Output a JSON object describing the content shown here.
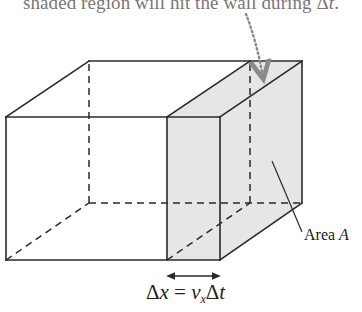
{
  "caption": {
    "text": "shaded region will hit the wall during ",
    "symbol": "Δ",
    "var": "t",
    "end": "."
  },
  "labels": {
    "area": {
      "text": "Area ",
      "var": "A"
    },
    "displacement": {
      "lhs_delta": "Δ",
      "lhs_var": "x",
      "equals": " = ",
      "v": "v",
      "v_sub": "x",
      "rhs_delta": "Δ",
      "rhs_var": "t"
    }
  },
  "colors": {
    "line": "#2a2a2a",
    "shade": "#e6e6e6",
    "dotted_arrow": "#8a8a8a",
    "caption": "#777777"
  },
  "geometry": {
    "box": {
      "front_top_left": [
        6,
        117
      ],
      "front_bottom_left": [
        6,
        260
      ],
      "back_top_left": [
        89,
        61
      ],
      "back_bottom_left": [
        89,
        203
      ],
      "shade_front_left_x": 167,
      "front_right_x": 220,
      "back_shade_left_x": 250,
      "back_right_x": 302
    }
  }
}
